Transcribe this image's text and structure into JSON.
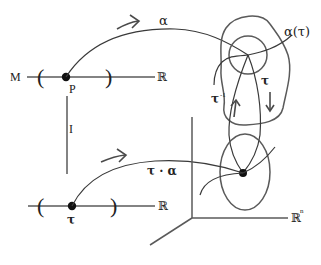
{
  "diagram": {
    "top_line": {
      "left_label": "M",
      "right_label": "ℝ",
      "left_paren": "(",
      "right_paren": ")",
      "point_label": "P"
    },
    "vertical_map_label": "I",
    "bottom_line": {
      "right_label": "ℝ",
      "left_paren": "(",
      "right_paren": ")",
      "point_label": "τ"
    },
    "curves": {
      "alpha_label": "α",
      "alpha_tau_label": "α(τ)",
      "tau_label": "τ",
      "tau_inverse_label": "τ",
      "tau_inverse_sup": "-1",
      "composition_label": "τ · α"
    },
    "axes": {
      "rn_label": "ℝ",
      "rn_sup": "n"
    },
    "colors": {
      "stroke": "#4a4a4a",
      "point": "#111111",
      "background": "#ffffff"
    }
  }
}
